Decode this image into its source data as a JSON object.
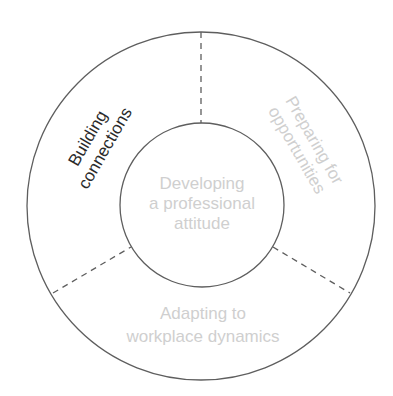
{
  "diagram": {
    "type": "concentric-ring-segmented",
    "colors": {
      "line": "#5e5e5e",
      "text_dark": "#2b2b2b",
      "text_light": "#cfcfcf",
      "background": "#ffffff"
    },
    "center": {
      "lines": [
        "Developing",
        "a professional",
        "attitude"
      ]
    },
    "segments": [
      {
        "id": "building-connections",
        "position": "upper-left",
        "lines": [
          "Building",
          "connections"
        ]
      },
      {
        "id": "preparing-for-opportunities",
        "position": "upper-right",
        "lines": [
          "Preparing for",
          "opportunities"
        ]
      },
      {
        "id": "adapting-to-workplace-dynamics",
        "position": "bottom",
        "lines": [
          "Adapting to",
          "workplace dynamics"
        ]
      }
    ]
  }
}
